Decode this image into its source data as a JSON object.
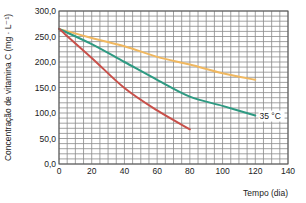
{
  "chart_data": {
    "type": "line",
    "title": "",
    "xlabel": "Tempo (dia)",
    "ylabel": "Concentração de vitamina C (mg · L⁻¹)",
    "xlim": [
      0,
      140
    ],
    "ylim": [
      0,
      300
    ],
    "x_ticks": [
      0,
      20,
      40,
      60,
      80,
      100,
      120,
      140
    ],
    "y_ticks": [
      0,
      50,
      100,
      150,
      200,
      250,
      300
    ],
    "y_tick_labels": [
      "0,0",
      "50,0",
      "100,0",
      "150,0",
      "200,0",
      "250,0",
      "300,0"
    ],
    "x_tick_labels": [
      "0",
      "20",
      "40",
      "60",
      "80",
      "100",
      "120",
      "140"
    ],
    "grid": true,
    "grid_minor_x_step": 5,
    "grid_minor_y_step": 10,
    "legend": "none",
    "series": [
      {
        "name": "orange",
        "color": "#f0b860",
        "x": [
          0,
          20,
          40,
          60,
          80,
          100,
          120
        ],
        "values": [
          265,
          247,
          231,
          210,
          195,
          178,
          165
        ]
      },
      {
        "name": "35 °C",
        "color": "#2e9a82",
        "x": [
          0,
          20,
          40,
          60,
          80,
          100,
          120
        ],
        "values": [
          265,
          235,
          200,
          165,
          132,
          114,
          95
        ]
      },
      {
        "name": "red",
        "color": "#c8504a",
        "x": [
          0,
          20,
          40,
          60,
          80
        ],
        "values": [
          265,
          208,
          149,
          105,
          68
        ]
      }
    ],
    "annotations": [
      {
        "text": "35 °C",
        "x": 122,
        "y": 95,
        "series": "35 °C"
      }
    ]
  }
}
